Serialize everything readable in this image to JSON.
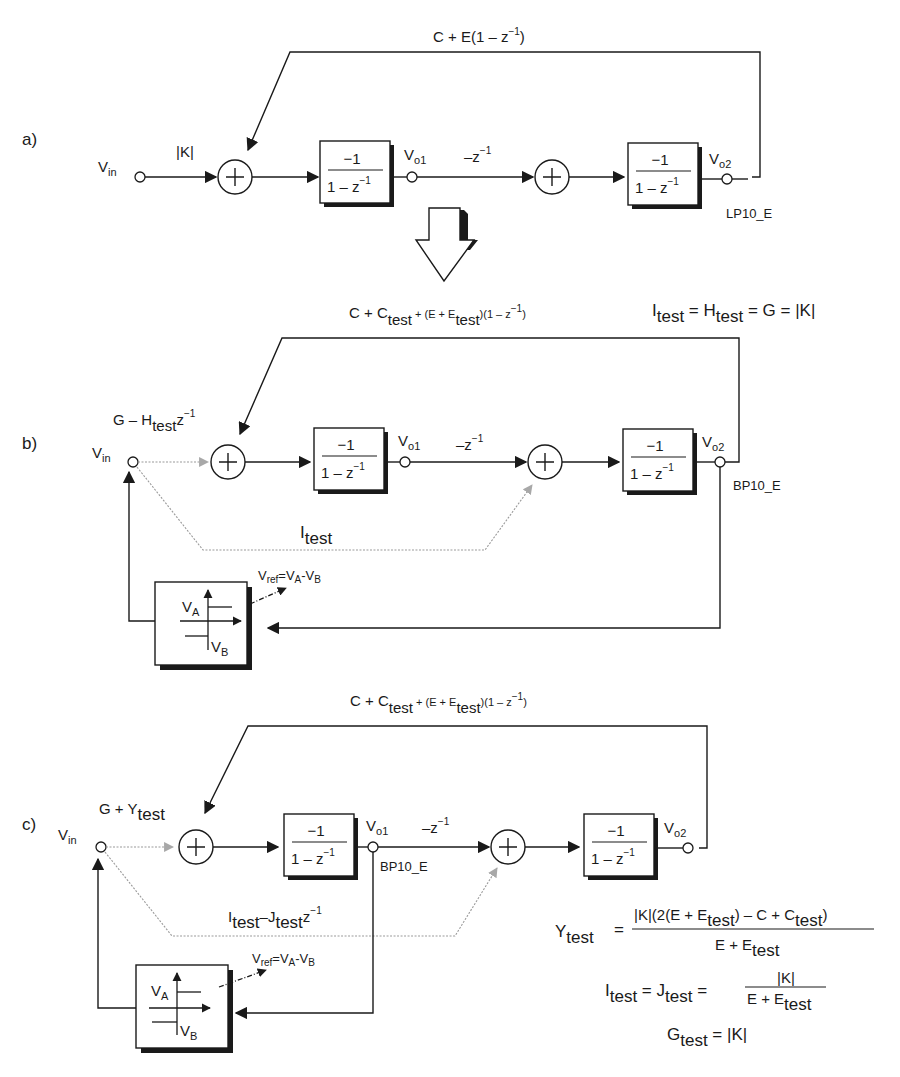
{
  "panels": {
    "a": {
      "label": "a)",
      "vin": "V",
      "vin_sub": "in",
      "gain": "|K|",
      "feedback": "C + E(1 – z",
      "feedback_sup": "−1",
      "feedback_close": ")",
      "integrator1": {
        "num": "−1",
        "den": "1 – z",
        "den_sup": "−1"
      },
      "integrator2": {
        "num": "−1",
        "den": "1 – z",
        "den_sup": "−1"
      },
      "vo1": "V",
      "vo1_sub": "o1",
      "vo2": "V",
      "vo2_sub": "o2",
      "delay": "–z",
      "delay_sup": "−1",
      "output_name": "LP10_E"
    },
    "b": {
      "label": "b)",
      "vin": "V",
      "vin_sub": "in",
      "input_gain": "G – H",
      "input_gain_sub": "test",
      "input_gain_z": "z",
      "input_gain_sup": "−1",
      "feedback_1": "C + C",
      "feedback_1_sub": "test",
      "feedback_2": " + (E + E",
      "feedback_2_sub": "test",
      "feedback_3": ")(1 – z",
      "feedback_sup": "−1",
      "feedback_close": ")",
      "relation": {
        "i": "I",
        "i_sub": "test",
        "eq1": " = H",
        "h_sub": "test",
        "rest": " = G = |K|"
      },
      "integrator1": {
        "num": "−1",
        "den": "1 – z",
        "den_sup": "−1"
      },
      "integrator2": {
        "num": "−1",
        "den": "1 – z",
        "den_sup": "−1"
      },
      "vo1": "V",
      "vo1_sub": "o1",
      "vo2": "V",
      "vo2_sub": "o2",
      "delay": "–z",
      "delay_sup": "−1",
      "output_name": "BP10_E",
      "test_path": "I",
      "test_path_sub": "test",
      "comparator": {
        "va": "V",
        "va_sub": "A",
        "vb": "V",
        "vb_sub": "B"
      },
      "vref": {
        "v": "V",
        "ref_sub": "ref",
        "eq": "=V",
        "a_sub": "A",
        "minus": "-V",
        "b_sub": "B"
      }
    },
    "c": {
      "label": "c)",
      "vin": "V",
      "vin_sub": "in",
      "input_gain": "G + Y",
      "input_gain_sub": "test",
      "feedback_1": "C + C",
      "feedback_1_sub": "test",
      "feedback_2": " + (E + E",
      "feedback_2_sub": "test",
      "feedback_3": ")(1 – z",
      "feedback_sup": "−1",
      "feedback_close": ")",
      "integrator1": {
        "num": "−1",
        "den": "1 – z",
        "den_sup": "−1"
      },
      "integrator2": {
        "num": "−1",
        "den": "1 – z",
        "den_sup": "−1"
      },
      "vo1": "V",
      "vo1_sub": "o1",
      "vo2": "V",
      "vo2_sub": "o2",
      "delay": "–z",
      "delay_sup": "−1",
      "output_name": "BP10_E",
      "test_path": "I",
      "test_path_sub": "test",
      "test_path_2": "–J",
      "test_path_2_sub": "test",
      "test_path_z": "z",
      "test_path_sup": "−1",
      "comparator": {
        "va": "V",
        "va_sub": "A",
        "vb": "V",
        "vb_sub": "B"
      },
      "vref": {
        "v": "V",
        "ref_sub": "ref",
        "eq": "=V",
        "a_sub": "A",
        "minus": "-V",
        "b_sub": "B"
      },
      "equations": {
        "y": {
          "lhs": "Y",
          "lhs_sub": "test",
          "eq": "=",
          "num_1": "|K|(2(E + E",
          "num_1_sub": "test",
          "num_2": ") – C + C",
          "num_2_sub": "test",
          "num_3": ")",
          "den": "E + E",
          "den_sub": "test"
        },
        "ij": {
          "i": "I",
          "i_sub": "test",
          "eq1": " = J",
          "j_sub": "test",
          "eq2": " =",
          "num": "|K|",
          "den": "E + E",
          "den_sub": "test"
        },
        "g": {
          "lhs": "G",
          "lhs_sub": "test",
          "rhs": " = |K|"
        }
      }
    }
  }
}
